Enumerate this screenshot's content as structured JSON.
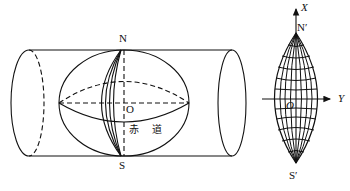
{
  "figure": {
    "left": {
      "title": "sphere-in-cylinder transverse projection",
      "labels": {
        "north": "N",
        "south": "S",
        "origin": "O",
        "equator": "赤 道"
      }
    },
    "right": {
      "title": "projected graticule",
      "labels": {
        "x_axis": "X",
        "y_axis": "Y",
        "north": "N′",
        "south": "S′",
        "origin": "O"
      }
    },
    "colors": {
      "stroke": "#111111",
      "background": "#ffffff"
    }
  }
}
